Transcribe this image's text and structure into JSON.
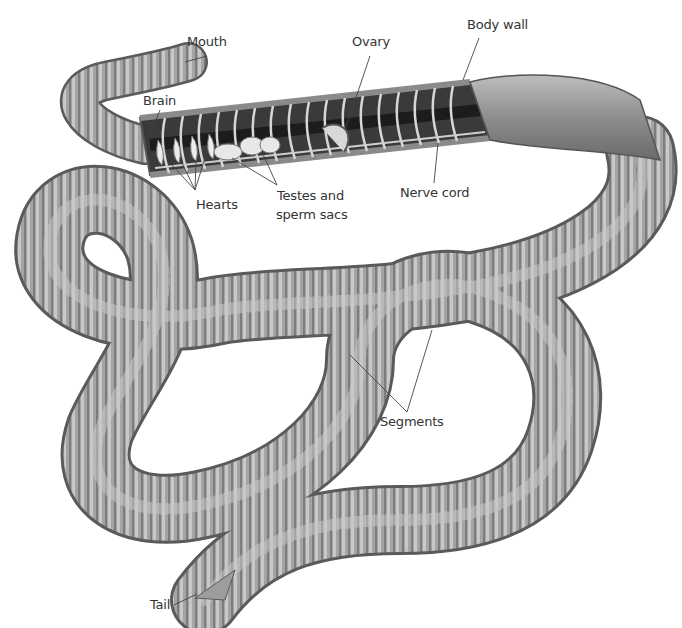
{
  "diagram": {
    "labels": {
      "mouth": "Mouth",
      "brain": "Brain",
      "hearts": "Hearts",
      "testes_line1": "Testes and",
      "testes_line2": "sperm sacs",
      "ovary": "Ovary",
      "body_wall": "Body wall",
      "nerve_cord": "Nerve cord",
      "segments": "Segments",
      "tail": "Tail"
    },
    "colors": {
      "body": "#a9a9a9",
      "body_dark": "#6f6f6f",
      "body_light": "#d4d4d4",
      "interior": "#2a2a2a",
      "organ": "#e6e6e6",
      "leader_line": "#444444",
      "text": "#333333"
    }
  }
}
